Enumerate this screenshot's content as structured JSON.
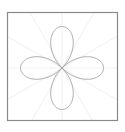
{
  "chart_data": {
    "type": "line",
    "subtype": "polar",
    "title": "",
    "xlabel": "",
    "ylabel": "",
    "equation_shape": "four-petal rose, petals along 0°, 90°, 180°, 270°",
    "function": "r = |cos(2θ)|",
    "theta_range_deg": [
      0,
      360
    ],
    "r_max": 1,
    "grid": true,
    "radial_grid_angles_deg": [
      0,
      30,
      60,
      90,
      120,
      150,
      180,
      210,
      240,
      270,
      300,
      330
    ],
    "legend": null,
    "series": [
      {
        "name": "rose",
        "points_sample": [
          {
            "theta_deg": 0,
            "r": 1.0
          },
          {
            "theta_deg": 22.5,
            "r": 0.707
          },
          {
            "theta_deg": 45,
            "r": 0.0
          },
          {
            "theta_deg": 67.5,
            "r": 0.707
          },
          {
            "theta_deg": 90,
            "r": 1.0
          },
          {
            "theta_deg": 112.5,
            "r": 0.707
          },
          {
            "theta_deg": 135,
            "r": 0.0
          },
          {
            "theta_deg": 157.5,
            "r": 0.707
          },
          {
            "theta_deg": 180,
            "r": 1.0
          },
          {
            "theta_deg": 202.5,
            "r": 0.707
          },
          {
            "theta_deg": 225,
            "r": 0.0
          },
          {
            "theta_deg": 247.5,
            "r": 0.707
          },
          {
            "theta_deg": 270,
            "r": 1.0
          },
          {
            "theta_deg": 292.5,
            "r": 0.707
          },
          {
            "theta_deg": 315,
            "r": 0.0
          },
          {
            "theta_deg": 337.5,
            "r": 0.707
          },
          {
            "theta_deg": 360,
            "r": 1.0
          }
        ]
      }
    ]
  },
  "style": {
    "frame_color": "#8a8a8a",
    "curve_color": "#9a9a9a",
    "grid_color": "#ececec",
    "background": "#ffffff"
  },
  "layout": {
    "frame": {
      "x": 7.5,
      "y": 12.5,
      "w": 110,
      "h": 108
    },
    "center": {
      "x": 62,
      "y": 68
    },
    "radius_px": 41.5,
    "grid_radius_px": 78
  }
}
